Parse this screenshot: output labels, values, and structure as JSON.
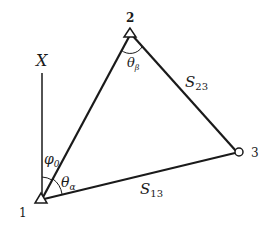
{
  "diagram": {
    "title": "",
    "points": [
      {
        "id": "1",
        "label": "1",
        "marker": "triangle"
      },
      {
        "id": "2",
        "label": "2",
        "marker": "triangle"
      },
      {
        "id": "3",
        "label": "3",
        "marker": "circle"
      }
    ],
    "axis_label": "X",
    "angle_labels": {
      "phi0": {
        "base": "φ",
        "sub": "0"
      },
      "theta_alpha": {
        "base": "θ",
        "sub": "α"
      },
      "theta_beta": {
        "base": "θ",
        "sub": "β"
      }
    },
    "side_labels": {
      "s23": {
        "base": "S",
        "sub": "23"
      },
      "s13": {
        "base": "S",
        "sub": "13"
      }
    },
    "colors": {
      "line": "#1a1a1a",
      "background": "#ffffff"
    }
  }
}
